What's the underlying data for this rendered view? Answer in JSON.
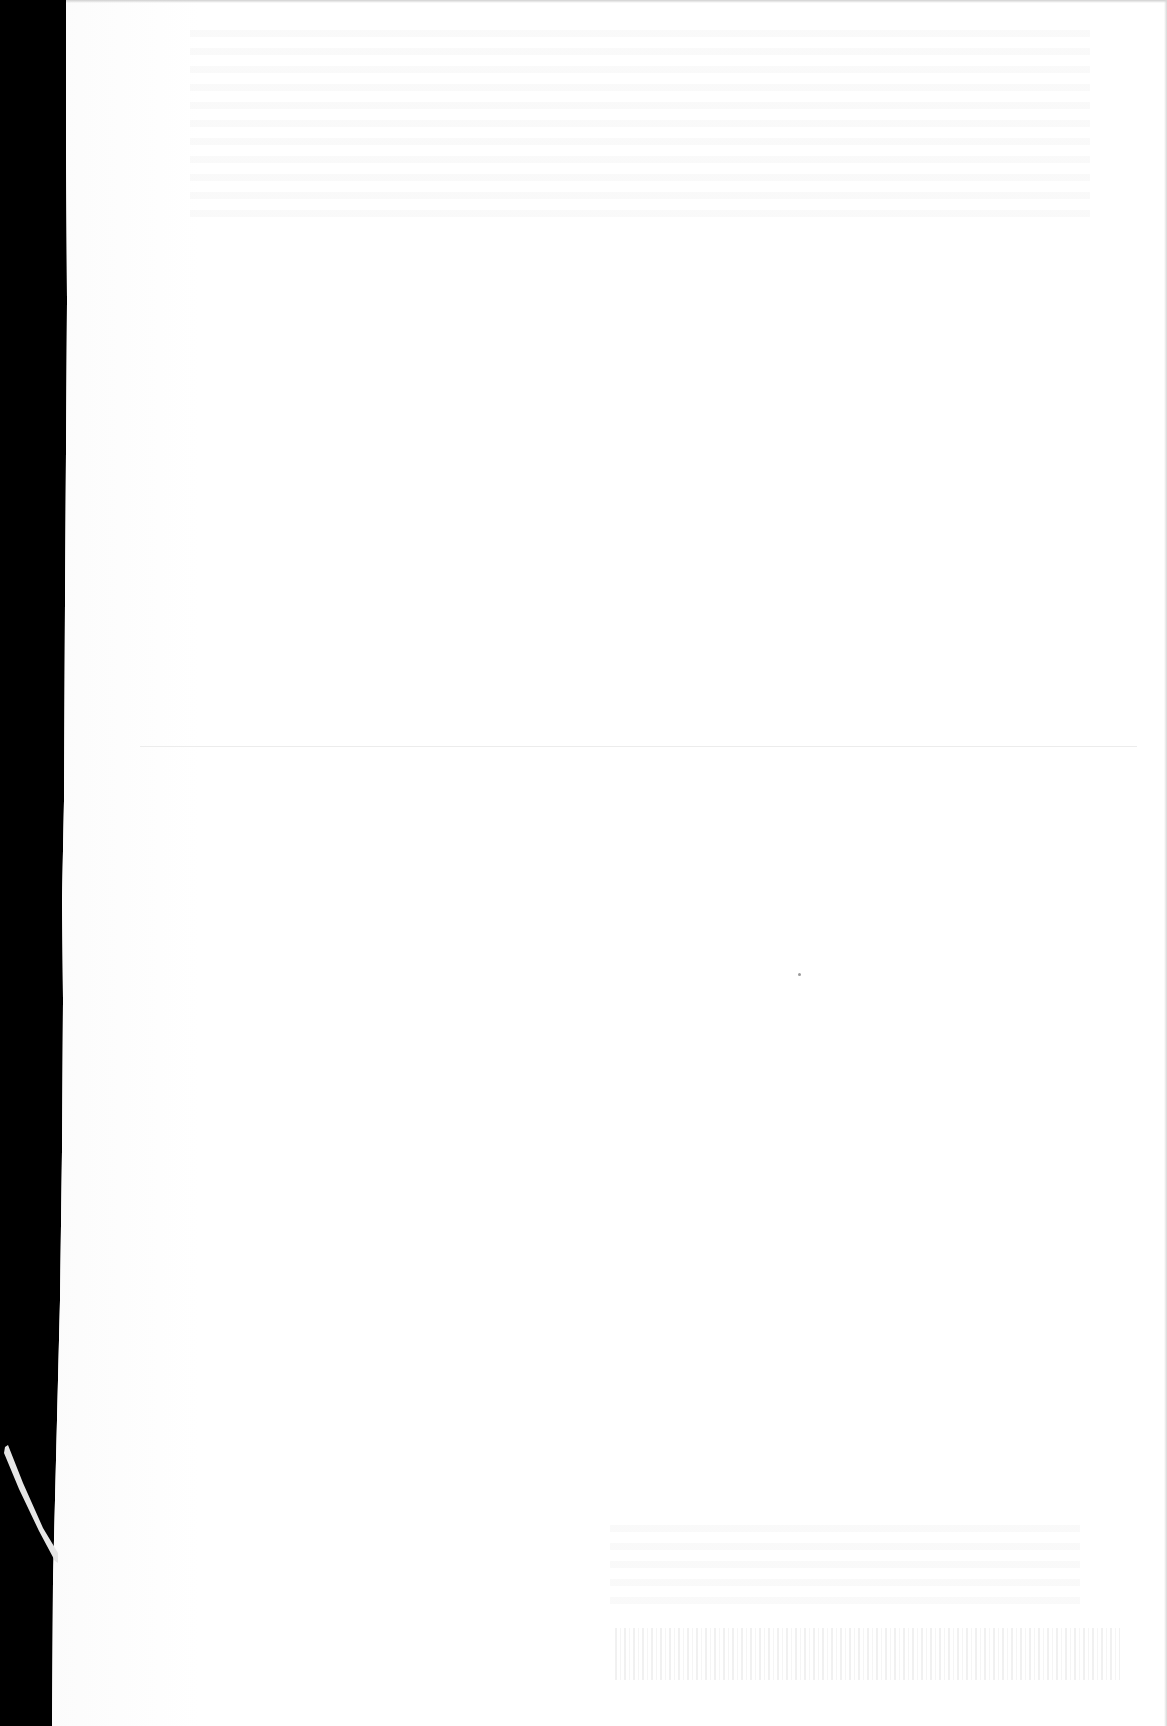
{
  "document": {
    "type": "scanned-page",
    "content": "blank page with faint show-through from reverse side",
    "colors": {
      "scanner_border": "#000000",
      "paper": "#fdfdfd",
      "fold_line": "#ececec"
    },
    "legible_text": []
  }
}
